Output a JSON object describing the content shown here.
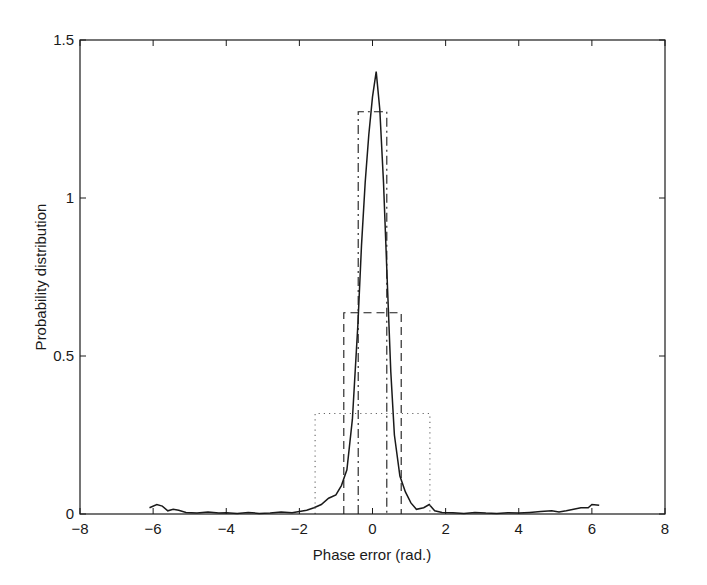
{
  "chart_data": {
    "type": "line",
    "title": "",
    "xlabel": "Phase error (rad.)",
    "ylabel": "Probability distribution",
    "xlim": [
      -8,
      8
    ],
    "ylim": [
      0,
      1.5
    ],
    "xticks": [
      -8,
      -6,
      -4,
      -2,
      0,
      2,
      4,
      6,
      8
    ],
    "xtick_labels": [
      "−8",
      "−6",
      "−4",
      "−2",
      "0",
      "2",
      "4",
      "6",
      "8"
    ],
    "yticks": [
      0,
      0.5,
      1,
      1.5
    ],
    "ytick_labels": [
      "0",
      "0.5",
      "1",
      "1.5"
    ],
    "grid": false,
    "legend": null,
    "series": [
      {
        "name": "measured phase error distribution",
        "style": "solid",
        "x": [
          -6.1,
          -5.9,
          -5.75,
          -5.6,
          -5.45,
          -5.3,
          -5.1,
          -4.8,
          -4.5,
          -4.2,
          -4.0,
          -3.7,
          -3.4,
          -3.1,
          -2.8,
          -2.5,
          -2.2,
          -2.0,
          -1.8,
          -1.6,
          -1.4,
          -1.2,
          -1.0,
          -0.85,
          -0.7,
          -0.55,
          -0.4,
          -0.3,
          -0.2,
          -0.1,
          0.0,
          0.1,
          0.2,
          0.3,
          0.4,
          0.5,
          0.6,
          0.75,
          0.9,
          1.05,
          1.2,
          1.4,
          1.55,
          1.7,
          1.9,
          2.2,
          2.5,
          2.8,
          3.1,
          3.4,
          3.7,
          4.0,
          4.3,
          4.6,
          4.9,
          5.1,
          5.3,
          5.5,
          5.7,
          5.9,
          6.0,
          6.2
        ],
        "y": [
          0.02,
          0.03,
          0.025,
          0.01,
          0.015,
          0.012,
          0.005,
          0.003,
          0.006,
          0.003,
          0.004,
          0.002,
          0.005,
          0.002,
          0.003,
          0.006,
          0.004,
          0.008,
          0.012,
          0.02,
          0.03,
          0.05,
          0.06,
          0.09,
          0.14,
          0.3,
          0.6,
          0.85,
          1.05,
          1.2,
          1.32,
          1.4,
          1.28,
          1.05,
          0.75,
          0.45,
          0.25,
          0.12,
          0.07,
          0.035,
          0.015,
          0.02,
          0.03,
          0.01,
          0.005,
          0.004,
          0.002,
          0.005,
          0.003,
          0.002,
          0.004,
          0.003,
          0.005,
          0.008,
          0.01,
          0.006,
          0.01,
          0.015,
          0.02,
          0.02,
          0.03,
          0.028
        ]
      },
      {
        "name": "uniform ±π/8",
        "style": "dashdot",
        "x": [
          -0.39,
          -0.39,
          0.39,
          0.39
        ],
        "y": [
          0,
          1.273,
          1.273,
          0
        ]
      },
      {
        "name": "uniform ±π/4",
        "style": "dashed",
        "x": [
          -0.785,
          -0.785,
          0.785,
          0.785
        ],
        "y": [
          0,
          0.637,
          0.637,
          0
        ]
      },
      {
        "name": "uniform ±π/2",
        "style": "dotted",
        "x": [
          -1.571,
          -1.571,
          1.571,
          1.571
        ],
        "y": [
          0,
          0.318,
          0.318,
          0
        ]
      }
    ],
    "colors": {
      "axis": "#1a1a1a",
      "line": "#1a1a1a",
      "background": "#ffffff"
    }
  },
  "layout": {
    "plot_left": 80,
    "plot_right": 665,
    "plot_top": 40,
    "plot_bottom": 514
  }
}
